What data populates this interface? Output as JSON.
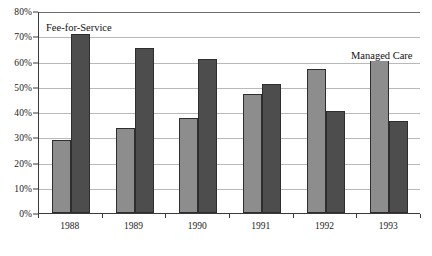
{
  "chart_data": {
    "type": "bar",
    "title": "",
    "subtitle": "",
    "xlabel": "",
    "ylabel": "",
    "categories": [
      "1988",
      "1989",
      "1990",
      "1991",
      "1992",
      "1993"
    ],
    "series": [
      {
        "name": "Fee-for-Service",
        "color": "#8d8d8d",
        "values": [
          29,
          33.5,
          37.5,
          47,
          57,
          60.5
        ]
      },
      {
        "name": "Managed Care",
        "color": "#4d4d4d",
        "values": [
          71,
          65.5,
          61,
          51,
          40.5,
          36.5
        ]
      }
    ],
    "ylim": [
      0,
      80
    ],
    "ytick_values": [
      0,
      10,
      20,
      30,
      40,
      50,
      60,
      70,
      80
    ],
    "ytick_labels": [
      "0%",
      "10%",
      "20%",
      "30%",
      "40%",
      "50%",
      "60%",
      "70%",
      "80%"
    ],
    "grid": true,
    "grid_axis": "y",
    "legend_position": "inline-annotations",
    "annotations": [
      {
        "text": "Fee-for-Service",
        "anchor": "top-left"
      },
      {
        "text": "Managed Care",
        "anchor": "top-right"
      }
    ]
  },
  "annotations": {
    "fee_for_service": "Fee-for-Service",
    "managed_care": "Managed Care"
  },
  "caption": {
    "sliver": ""
  }
}
